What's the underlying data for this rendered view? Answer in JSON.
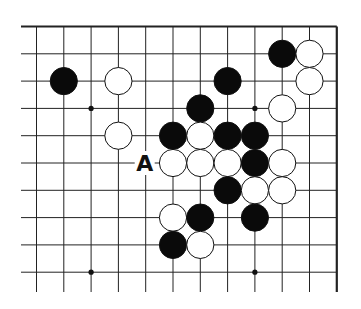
{
  "diagram": {
    "type": "go-board-fragment",
    "columns": 11,
    "rows": 10,
    "edges": [
      "top",
      "right"
    ],
    "stones": [
      {
        "color": "black",
        "col": 9,
        "row": 1
      },
      {
        "color": "white",
        "col": 10,
        "row": 1
      },
      {
        "color": "black",
        "col": 1,
        "row": 2
      },
      {
        "color": "white",
        "col": 3,
        "row": 2
      },
      {
        "color": "black",
        "col": 7,
        "row": 2
      },
      {
        "color": "white",
        "col": 10,
        "row": 2
      },
      {
        "color": "black",
        "col": 6,
        "row": 3
      },
      {
        "color": "white",
        "col": 9,
        "row": 3
      },
      {
        "color": "white",
        "col": 3,
        "row": 4
      },
      {
        "color": "black",
        "col": 5,
        "row": 4
      },
      {
        "color": "white",
        "col": 6,
        "row": 4
      },
      {
        "color": "black",
        "col": 7,
        "row": 4
      },
      {
        "color": "black",
        "col": 8,
        "row": 4
      },
      {
        "color": "white",
        "col": 5,
        "row": 5
      },
      {
        "color": "white",
        "col": 6,
        "row": 5
      },
      {
        "color": "white",
        "col": 7,
        "row": 5
      },
      {
        "color": "black",
        "col": 8,
        "row": 5
      },
      {
        "color": "white",
        "col": 9,
        "row": 5
      },
      {
        "color": "black",
        "col": 7,
        "row": 6
      },
      {
        "color": "white",
        "col": 8,
        "row": 6
      },
      {
        "color": "white",
        "col": 9,
        "row": 6
      },
      {
        "color": "white",
        "col": 5,
        "row": 7
      },
      {
        "color": "black",
        "col": 6,
        "row": 7
      },
      {
        "color": "black",
        "col": 8,
        "row": 7
      },
      {
        "color": "black",
        "col": 5,
        "row": 8
      },
      {
        "color": "white",
        "col": 6,
        "row": 8
      }
    ],
    "star_points": [
      {
        "col": 2,
        "row": 3
      },
      {
        "col": 8,
        "row": 3
      },
      {
        "col": 2,
        "row": 9
      },
      {
        "col": 8,
        "row": 9
      }
    ],
    "labels": [
      {
        "text": "A",
        "col": 4,
        "row": 5
      }
    ]
  }
}
